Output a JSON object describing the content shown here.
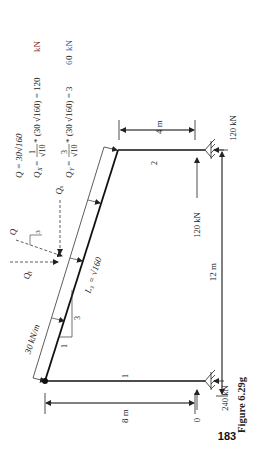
{
  "page": {
    "page_number": "183",
    "figure_caption": "Figure 6.29g"
  },
  "equations": {
    "q": "Q  = 30√160",
    "qx_lhs": "Q",
    "qx_sub": "X",
    "qx_eq": " = ",
    "qx_num": "1",
    "qx_den": "√10",
    "qx_rhs_a": " * (30 √160) = 120 ",
    "qx_unit": "kN",
    "qy_lhs": "Q",
    "qy_sub": "Y",
    "qy_eq": " = ",
    "qy_num": "3",
    "qy_den": "√10",
    "qy_rhs_a": " * (30 √160) = 3",
    "qy_rhs_b": "6",
    "qy_rhs_c": "0 ",
    "qy_unit": "kN"
  },
  "diagram": {
    "distributed_load": "30 kN/m",
    "member_length": "L₃ = √160",
    "slope_run": "1",
    "slope_rise": "3",
    "resultant_label": "Q",
    "qx_label": "Qₓ",
    "qy_label": "Qᵧ",
    "member_1": "1",
    "member_2": "2",
    "dim_4m": "4 m",
    "dim_8m": "8 m",
    "dim_12m": "12 m",
    "reaction_right_horizontal": "120 kN",
    "reaction_right_vertical": "120 kN",
    "reaction_left_horizontal": "0",
    "reaction_left_vertical": "240 kN",
    "slope_small_3": "3"
  }
}
